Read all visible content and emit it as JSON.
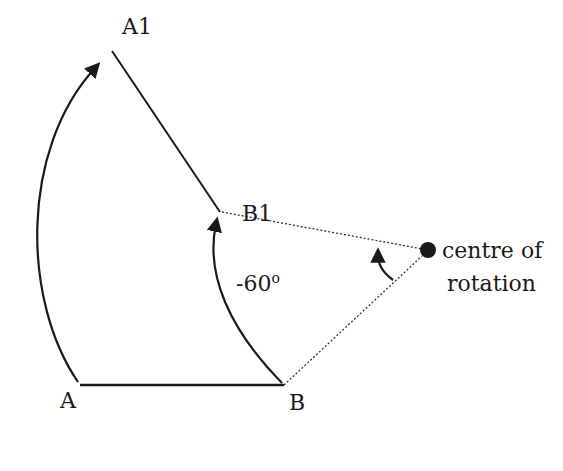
{
  "diagram": {
    "points": {
      "A": {
        "label": "A"
      },
      "B": {
        "label": "B"
      },
      "A1": {
        "label": "A1"
      },
      "B1": {
        "label": "B1"
      }
    },
    "angle_label": "-60",
    "degree_symbol": "o",
    "centre_label_line1": "centre of",
    "centre_label_line2": "rotation",
    "colors": {
      "ink": "#1a1a1a",
      "background": "#ffffff"
    }
  }
}
